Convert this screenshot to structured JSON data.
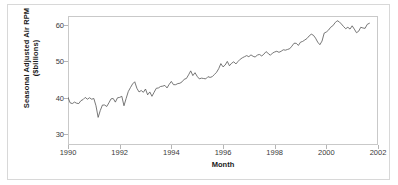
{
  "chart_data": {
    "type": "line",
    "title": "",
    "subtitle": "",
    "xlabel": "Month",
    "ylabel_line1": "Seasonal Adjusted Air RPM",
    "ylabel_line2": "($billions)",
    "ylabel": "Seasonal Adjusted Air RPM ($billions)",
    "grid": false,
    "legend": "none",
    "xlim": [
      1990.0,
      2002.0
    ],
    "ylim": [
      27.0,
      62.5
    ],
    "xticks": [
      1990,
      1992,
      1994,
      1996,
      1998,
      2000,
      2002
    ],
    "xtick_labels": [
      "1990",
      "1992",
      "1994",
      "1996",
      "1998",
      "2000",
      "2002"
    ],
    "yticks": [
      30,
      40,
      50,
      60
    ],
    "ytick_labels": [
      "30",
      "40",
      "50",
      "60"
    ],
    "line_color": "#555555",
    "series": [
      {
        "name": "Seasonal Adjusted Air RPM",
        "x": [
          1990.0,
          1990.083,
          1990.167,
          1990.25,
          1990.333,
          1990.417,
          1990.5,
          1990.583,
          1990.667,
          1990.75,
          1990.833,
          1990.917,
          1991.0,
          1991.083,
          1991.167,
          1991.25,
          1991.333,
          1991.417,
          1991.5,
          1991.583,
          1991.667,
          1991.75,
          1991.833,
          1991.917,
          1992.0,
          1992.083,
          1992.167,
          1992.25,
          1992.333,
          1992.417,
          1992.5,
          1992.583,
          1992.667,
          1992.75,
          1992.833,
          1992.917,
          1993.0,
          1993.083,
          1993.167,
          1993.25,
          1993.333,
          1993.417,
          1993.5,
          1993.583,
          1993.667,
          1993.75,
          1993.833,
          1993.917,
          1994.0,
          1994.083,
          1994.167,
          1994.25,
          1994.333,
          1994.417,
          1994.5,
          1994.583,
          1994.667,
          1994.75,
          1994.833,
          1994.917,
          1995.0,
          1995.083,
          1995.167,
          1995.25,
          1995.333,
          1995.417,
          1995.5,
          1995.583,
          1995.667,
          1995.75,
          1995.833,
          1995.917,
          1996.0,
          1996.083,
          1996.167,
          1996.25,
          1996.333,
          1996.417,
          1996.5,
          1996.583,
          1996.667,
          1996.75,
          1996.833,
          1996.917,
          1997.0,
          1997.083,
          1997.167,
          1997.25,
          1997.333,
          1997.417,
          1997.5,
          1997.583,
          1997.667,
          1997.75,
          1997.833,
          1997.917,
          1998.0,
          1998.083,
          1998.167,
          1998.25,
          1998.333,
          1998.417,
          1998.5,
          1998.583,
          1998.667,
          1998.75,
          1998.833,
          1998.917,
          1999.0,
          1999.083,
          1999.167,
          1999.25,
          1999.333,
          1999.417,
          1999.5,
          1999.583,
          1999.667,
          1999.75,
          1999.833,
          1999.917,
          2000.0,
          2000.083,
          2000.167,
          2000.25,
          2000.333,
          2000.417,
          2000.5,
          2000.583,
          2000.667,
          2000.75,
          2000.833,
          2000.917,
          2001.0,
          2001.083,
          2001.167,
          2001.25,
          2001.333,
          2001.417,
          2001.5,
          2001.583,
          2001.667
        ],
        "values": [
          40.1,
          38.6,
          38.4,
          38.8,
          38.5,
          38.4,
          39.2,
          39.5,
          40.1,
          39.6,
          40.0,
          39.6,
          39.8,
          37.8,
          34.6,
          36.5,
          38.0,
          38.0,
          37.6,
          38.6,
          39.7,
          39.8,
          38.8,
          40.0,
          40.1,
          40.4,
          37.8,
          39.8,
          41.7,
          42.8,
          43.8,
          44.4,
          42.6,
          41.6,
          42.0,
          41.5,
          42.4,
          40.8,
          41.6,
          40.4,
          41.5,
          42.6,
          42.7,
          43.1,
          43.2,
          43.4,
          42.7,
          43.7,
          44.5,
          43.6,
          43.6,
          43.9,
          44.0,
          44.4,
          45.1,
          45.3,
          46.3,
          47.4,
          46.1,
          46.9,
          45.9,
          45.2,
          45.4,
          45.3,
          45.2,
          45.8,
          45.6,
          45.8,
          46.4,
          47.0,
          48.0,
          49.4,
          48.5,
          49.0,
          50.0,
          48.8,
          49.5,
          49.9,
          49.3,
          50.0,
          50.6,
          51.0,
          51.3,
          51.6,
          51.3,
          51.8,
          51.4,
          51.2,
          51.8,
          51.9,
          51.5,
          52.0,
          52.7,
          52.2,
          51.7,
          52.3,
          52.6,
          52.8,
          52.5,
          52.8,
          53.2,
          53.1,
          53.3,
          53.5,
          54.2,
          55.0,
          55.0,
          54.4,
          55.3,
          55.5,
          55.9,
          56.3,
          57.0,
          57.5,
          57.2,
          56.4,
          55.3,
          54.6,
          55.6,
          57.8,
          58.1,
          58.6,
          59.4,
          59.8,
          60.6,
          61.2,
          60.9,
          60.3,
          59.6,
          59.0,
          59.4,
          58.9,
          59.8,
          58.9,
          57.9,
          58.3,
          59.4,
          59.2,
          59.1,
          60.2,
          60.5
        ]
      }
    ]
  }
}
